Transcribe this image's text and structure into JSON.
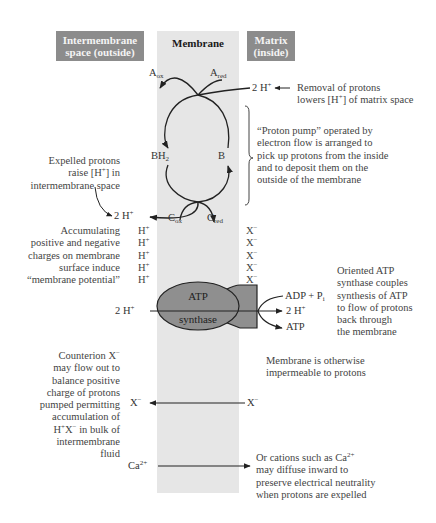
{
  "headers": {
    "intermembrane": "Intermembrane space (outside)",
    "membrane": "Membrane",
    "matrix": "Matrix (inside)"
  },
  "colors": {
    "header_dark": "#8c8c8c",
    "membrane": "#e6e6e6",
    "atp_synthase": "#8f8f8f",
    "arrows": "#222222"
  },
  "electron_carriers": {
    "A_ox": {
      "base": "A",
      "sub": "ox"
    },
    "A_red": {
      "base": "A",
      "sub": "red"
    },
    "BH2": {
      "base": "BH",
      "sub": "2"
    },
    "B": {
      "base": "B"
    },
    "C_ox": {
      "base": "C",
      "sub": "ox"
    },
    "C_red": {
      "base": "C",
      "sub": "red"
    }
  },
  "ions": {
    "two_h_plus": {
      "base": "2 H",
      "sup": "+"
    },
    "h_plus": {
      "base": "H",
      "sup": "+"
    },
    "x_minus": {
      "base": "X",
      "sup": "−"
    },
    "ca2_plus": {
      "base": "Ca",
      "sup": "2+"
    },
    "adp_pi": {
      "base": "ADP + P",
      "sub": "i"
    },
    "atp": "ATP"
  },
  "charge_column": {
    "left": [
      "H+",
      "H+",
      "H+",
      "H+",
      "H+"
    ],
    "right": [
      "X−",
      "X−",
      "X−",
      "X−",
      "X−"
    ]
  },
  "atp_synthase": {
    "line1": "ATP",
    "line2": "synthase"
  },
  "annotations": {
    "removal": [
      "Removal of protons",
      "lowers [H+] of matrix space"
    ],
    "proton_pump": [
      "“Proton pump” operated by",
      "electron flow is arranged to",
      "pick up protons from the inside",
      "and to deposit them on the",
      "outside of the membrane"
    ],
    "expelled": [
      "Expelled protons",
      "raise [H+] in",
      "intermembrane space"
    ],
    "accumulating": [
      "Accumulating",
      "positive and negative",
      "charges on membrane",
      "surface induce",
      "“membrane potential”"
    ],
    "oriented": [
      "Oriented ATP",
      "synthase couples",
      "synthesis of ATP",
      "to flow of protons",
      "back through",
      "the membrane"
    ],
    "impermeable": [
      "Membrane is otherwise",
      "impermeable to protons"
    ],
    "counterion": [
      "Counterion X−",
      "may flow out to",
      "balance positive",
      "charge of protons",
      "pumped permitting",
      "accumulation of",
      "H+X− in bulk of",
      "intermembrane",
      "fluid"
    ],
    "cations": [
      "Or cations such as Ca2+",
      "may diffuse inward to",
      "preserve electrical neutrality",
      "when protons are expelled"
    ]
  }
}
